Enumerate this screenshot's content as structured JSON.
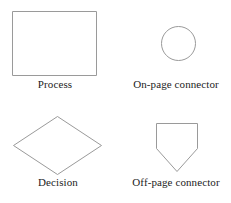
{
  "diagram": {
    "background_color": "#ffffff",
    "stroke_color": "#9a9a9a",
    "text_color": "#1c1c1c",
    "shapes": [
      {
        "id": "process",
        "label": "Process",
        "shape": "rectangle",
        "icon_name": "rectangle-shape",
        "geometry": {
          "x": 12,
          "y": 11,
          "width": 85,
          "height": 65
        }
      },
      {
        "id": "on-page-connector",
        "label": "On-page connector",
        "shape": "circle",
        "icon_name": "circle-shape",
        "geometry": {
          "cx": 178,
          "cy": 44,
          "r": 17.5,
          "width": 35,
          "height": 35
        }
      },
      {
        "id": "decision",
        "label": "Decision",
        "shape": "diamond",
        "icon_name": "diamond-shape",
        "geometry": {
          "x": 13,
          "y": 116,
          "width": 89,
          "height": 59
        }
      },
      {
        "id": "off-page-connector",
        "label": "Off-page connector",
        "shape": "pentagon",
        "icon_name": "pentagon-shape",
        "geometry": {
          "x": 156,
          "y": 123,
          "width": 42,
          "height": 49,
          "shoulder_y": 25
        }
      }
    ]
  }
}
